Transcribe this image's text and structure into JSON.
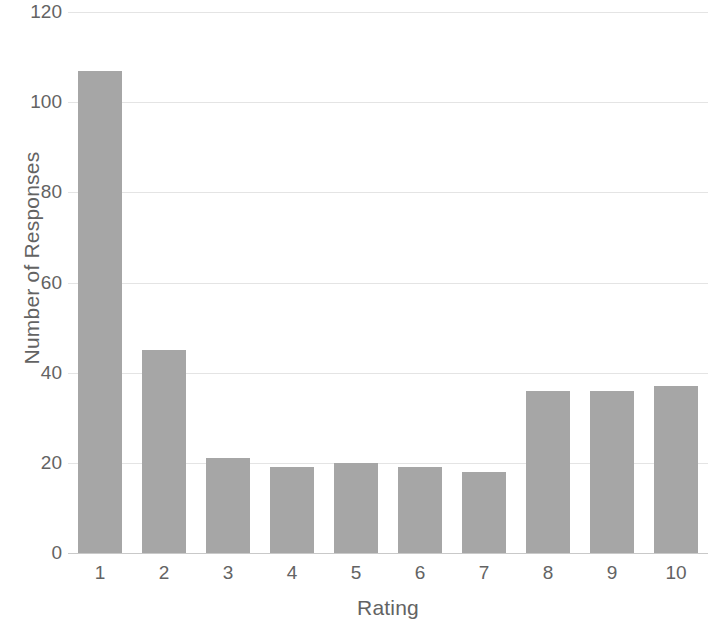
{
  "chart_data": {
    "type": "bar",
    "title": "",
    "xlabel": "Rating",
    "ylabel": "Number of Responses",
    "categories": [
      "1",
      "2",
      "3",
      "4",
      "5",
      "6",
      "7",
      "8",
      "9",
      "10"
    ],
    "values": [
      107,
      45,
      21,
      19,
      20,
      19,
      18,
      36,
      36,
      37
    ],
    "ylim": [
      0,
      120
    ],
    "ytick_labels": [
      "0",
      "20",
      "40",
      "60",
      "80",
      "100",
      "120"
    ],
    "ytick_values": [
      0,
      20,
      40,
      60,
      80,
      100,
      120
    ],
    "grid": true,
    "legend": false,
    "legend_position": "none",
    "bar_color": "#a6a6a6",
    "gridline_color": "#e4e4e4",
    "text_color": "#636363",
    "background_color": "#ffffff"
  }
}
